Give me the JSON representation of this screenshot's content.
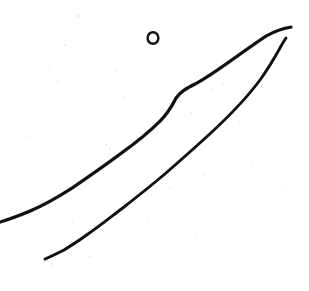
{
  "image": {
    "kind": "scanned-ink-line-drawing",
    "width": 309,
    "height": 291,
    "background_color": "#ffffff",
    "ink_color": "#111111",
    "speck_color": "#c9c9c9",
    "description": "Scanned hand-drawn ink sketch: two nearly parallel rough diagonal strokes running from lower-left to upper-right, plus a small open ring near the top centre, on speckled white paper."
  },
  "strokes": [
    {
      "name": "upper-long-stroke",
      "label": "Upper diagonal ink stroke",
      "color": "#111111",
      "width": 3.1,
      "start": [
        0,
        222
      ],
      "end": [
        291,
        27
      ],
      "kink": [
        176,
        97
      ],
      "path": "M0,222 C10,219 18,216 30,211 C44,205 58,197 72,188 C88,177 104,166 120,154 C134,144 148,133 160,121 C167,114 172,106 176,98 C181,91 187,88 195,84 C206,78 216,71 226,64 C240,54 254,44 266,36 C275,31 284,28 291,27"
    },
    {
      "name": "lower-long-stroke",
      "label": "Lower diagonal ink stroke",
      "color": "#111111",
      "width": 2.9,
      "start": [
        45,
        259
      ],
      "end": [
        286,
        38
      ],
      "path": "M45,259 C52,256 58,253 64,250 C72,245 80,240 88,234 C100,226 112,216 124,207 C138,196 152,185 166,173 C182,159 198,145 214,130 C230,115 246,99 260,80 C268,69 275,57 280,48 C282,44 284,41 286,38"
    }
  ],
  "ring": {
    "name": "small-open-ring",
    "label": "Small open ring mark",
    "center": [
      153,
      38
    ],
    "radius_x": 5.4,
    "radius_y": 5.8,
    "stroke_width": 2.4,
    "color": "#111111"
  },
  "specks": [
    {
      "x": 78,
      "y": 16,
      "size": 2.0,
      "opacity": 0.55
    },
    {
      "x": 65,
      "y": 45,
      "size": 1.6,
      "opacity": 0.35
    },
    {
      "x": 50,
      "y": 69,
      "size": 1.4,
      "opacity": 0.28
    },
    {
      "x": 117,
      "y": 71,
      "size": 1.3,
      "opacity": 0.3
    },
    {
      "x": 58,
      "y": 81,
      "size": 1.2,
      "opacity": 0.25
    },
    {
      "x": 123,
      "y": 97,
      "size": 1.5,
      "opacity": 0.32
    },
    {
      "x": 29,
      "y": 136,
      "size": 1.7,
      "opacity": 0.38
    },
    {
      "x": 106,
      "y": 145,
      "size": 2.0,
      "opacity": 0.5
    },
    {
      "x": 110,
      "y": 149,
      "size": 1.6,
      "opacity": 0.45
    },
    {
      "x": 114,
      "y": 152,
      "size": 1.3,
      "opacity": 0.35
    },
    {
      "x": 191,
      "y": 113,
      "size": 1.6,
      "opacity": 0.34
    },
    {
      "x": 196,
      "y": 120,
      "size": 1.3,
      "opacity": 0.3
    },
    {
      "x": 212,
      "y": 90,
      "size": 1.5,
      "opacity": 0.33
    },
    {
      "x": 223,
      "y": 84,
      "size": 1.4,
      "opacity": 0.3
    },
    {
      "x": 230,
      "y": 136,
      "size": 1.4,
      "opacity": 0.28
    },
    {
      "x": 239,
      "y": 122,
      "size": 1.2,
      "opacity": 0.26
    },
    {
      "x": 176,
      "y": 123,
      "size": 1.3,
      "opacity": 0.27
    },
    {
      "x": 204,
      "y": 175,
      "size": 1.5,
      "opacity": 0.3
    },
    {
      "x": 253,
      "y": 163,
      "size": 1.3,
      "opacity": 0.26
    },
    {
      "x": 170,
      "y": 188,
      "size": 1.2,
      "opacity": 0.24
    },
    {
      "x": 78,
      "y": 190,
      "size": 1.3,
      "opacity": 0.26
    },
    {
      "x": 73,
      "y": 222,
      "size": 1.4,
      "opacity": 0.28
    },
    {
      "x": 90,
      "y": 257,
      "size": 1.6,
      "opacity": 0.4
    },
    {
      "x": 48,
      "y": 261,
      "size": 1.8,
      "opacity": 0.48
    },
    {
      "x": 52,
      "y": 264,
      "size": 1.4,
      "opacity": 0.4
    },
    {
      "x": 43,
      "y": 262,
      "size": 1.5,
      "opacity": 0.42
    },
    {
      "x": 196,
      "y": 234,
      "size": 1.2,
      "opacity": 0.22
    },
    {
      "x": 265,
      "y": 200,
      "size": 1.2,
      "opacity": 0.22
    },
    {
      "x": 286,
      "y": 186,
      "size": 1.1,
      "opacity": 0.2
    },
    {
      "x": 148,
      "y": 218,
      "size": 1.1,
      "opacity": 0.2
    },
    {
      "x": 117,
      "y": 112,
      "size": 1.2,
      "opacity": 0.24
    },
    {
      "x": 39,
      "y": 104,
      "size": 1.1,
      "opacity": 0.2
    }
  ]
}
